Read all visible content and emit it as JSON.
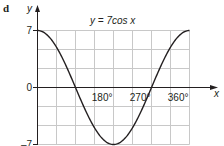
{
  "part_label": "d",
  "chart_data": {
    "type": "line",
    "title": "y = 7cos x",
    "xlabel": "x",
    "ylabel": "y",
    "xlim": [
      0,
      360
    ],
    "ylim": [
      -7,
      7
    ],
    "x_ticks": [
      {
        "value": 180,
        "label": "180°"
      },
      {
        "value": 270,
        "label": "270°"
      },
      {
        "value": 360,
        "label": "360°"
      }
    ],
    "y_ticks": [
      {
        "value": 7,
        "label": "7"
      },
      {
        "value": 0,
        "label": "0"
      },
      {
        "value": -7,
        "label": "–7"
      }
    ],
    "grid": true,
    "grid_x_step": 45,
    "grid_y_rows": 6,
    "series": [
      {
        "name": "y = 7cos x",
        "function": "7cos(x)",
        "x": [
          0,
          45,
          90,
          135,
          180,
          225,
          270,
          315,
          360
        ],
        "values": [
          7,
          4.95,
          0,
          -4.95,
          -7,
          -4.95,
          0,
          4.95,
          7
        ]
      }
    ],
    "colors": {
      "curve": "#231f20",
      "axis": "#231f20",
      "grid": "#c8c8c8"
    }
  }
}
